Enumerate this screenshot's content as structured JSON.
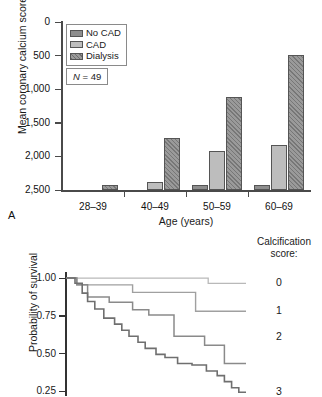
{
  "panel_a": {
    "letter": "A",
    "ylabel": "Mean coronary calcium score",
    "xlabel": "Age (years)",
    "yticks": [
      "2,500",
      "2,000",
      "1,500",
      "1,000",
      "500",
      "0"
    ],
    "categories": [
      "28–39",
      "40–49",
      "50–59",
      "60–69"
    ],
    "legend": [
      {
        "label": "No CAD",
        "swatch": "nocad"
      },
      {
        "label": "CAD",
        "swatch": "cad"
      },
      {
        "label": "Dialysis",
        "swatch": "dialysis"
      }
    ],
    "n_label_italic": "N",
    "n_label_rest": " = 49"
  },
  "panel_b": {
    "ylabel": "Probability of survival",
    "yticks": [
      "1.00",
      "0.75",
      "0.50",
      "0.25"
    ],
    "legend_title": "Calcification score:",
    "legend_title_line1": "Calcification",
    "legend_title_line2": "score:",
    "keys": [
      "0",
      "1",
      "2",
      "3"
    ]
  },
  "colors": {
    "no_cad": "#8e8e8e",
    "cad": "#bdbdbd",
    "dialysis": "#9a9a9a",
    "axis": "#4a4a4a",
    "curve_0": "#b9b9b9",
    "curve_1": "#a0a0a0",
    "curve_2": "#8a8a8a",
    "curve_3": "#6f6f6f"
  },
  "chart_data": [
    {
      "type": "bar",
      "title": "",
      "panel": "A",
      "xlabel": "Age (years)",
      "ylabel": "Mean coronary calcium score",
      "categories": [
        "28-39",
        "40-49",
        "50-59",
        "60-69"
      ],
      "ylim": [
        0,
        2500
      ],
      "yticks": [
        0,
        500,
        1000,
        1500,
        2000,
        2500
      ],
      "grid": false,
      "legend_position": "top-left",
      "annotation": "N = 49",
      "series": [
        {
          "name": "No CAD",
          "values": [
            0,
            0,
            80,
            75
          ]
        },
        {
          "name": "CAD",
          "values": [
            0,
            120,
            585,
            670
          ]
        },
        {
          "name": "Dialysis",
          "values": [
            80,
            775,
            1390,
            2010
          ]
        }
      ]
    },
    {
      "type": "line",
      "panel": "B",
      "subtype": "kaplan-meier-step",
      "title": "",
      "xlabel": "",
      "ylabel": "Probability of survival",
      "legend_title": "Calcification score:",
      "ylim": [
        0.22,
        1.02
      ],
      "yticks": [
        0.25,
        0.5,
        0.75,
        1.0
      ],
      "xlim": [
        0,
        1
      ],
      "grid": false,
      "legend_position": "right",
      "series": [
        {
          "name": "0",
          "x": [
            0.0,
            0.37,
            0.37,
            0.79,
            0.79,
            1.0
          ],
          "y": [
            1.0,
            1.0,
            1.0,
            1.0,
            0.965,
            0.965
          ]
        },
        {
          "name": "1",
          "x": [
            0.0,
            0.06,
            0.06,
            0.37,
            0.37,
            0.72,
            0.72,
            1.0
          ],
          "y": [
            1.0,
            1.0,
            0.955,
            0.955,
            0.905,
            0.905,
            0.78,
            0.78
          ]
        },
        {
          "name": "2",
          "x": [
            0.0,
            0.06,
            0.06,
            0.12,
            0.12,
            0.24,
            0.24,
            0.37,
            0.37,
            0.46,
            0.46,
            0.6,
            0.6,
            0.77,
            0.77,
            0.88,
            0.88,
            1.0
          ],
          "y": [
            1.0,
            1.0,
            0.955,
            0.955,
            0.875,
            0.875,
            0.84,
            0.84,
            0.79,
            0.79,
            0.755,
            0.755,
            0.615,
            0.615,
            0.555,
            0.555,
            0.435,
            0.435
          ]
        },
        {
          "name": "3",
          "x": [
            0.0,
            0.05,
            0.05,
            0.09,
            0.09,
            0.12,
            0.12,
            0.16,
            0.16,
            0.21,
            0.21,
            0.27,
            0.27,
            0.31,
            0.31,
            0.35,
            0.35,
            0.4,
            0.4,
            0.44,
            0.44,
            0.5,
            0.5,
            0.55,
            0.55,
            0.62,
            0.62,
            0.7,
            0.7,
            0.78,
            0.78,
            0.84,
            0.84,
            0.88,
            0.88,
            0.92,
            0.92,
            0.96,
            0.96,
            1.0
          ],
          "y": [
            1.0,
            1.0,
            0.965,
            0.965,
            0.9,
            0.9,
            0.845,
            0.845,
            0.795,
            0.795,
            0.735,
            0.735,
            0.695,
            0.695,
            0.655,
            0.655,
            0.615,
            0.615,
            0.575,
            0.575,
            0.535,
            0.535,
            0.495,
            0.495,
            0.475,
            0.475,
            0.435,
            0.435,
            0.425,
            0.425,
            0.385,
            0.385,
            0.355,
            0.355,
            0.315,
            0.315,
            0.275,
            0.275,
            0.245,
            0.245
          ]
        }
      ]
    }
  ]
}
